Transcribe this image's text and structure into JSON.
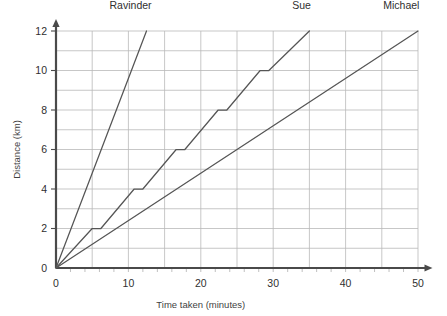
{
  "chart_data": {
    "type": "line",
    "title": "",
    "xlabel": "Time taken (minutes)",
    "ylabel": "Distance (km)",
    "xlim": [
      0,
      52
    ],
    "ylim": [
      0,
      12
    ],
    "xticks": [
      0,
      10,
      20,
      30,
      40,
      50
    ],
    "xtick_labels": [
      "0",
      "10",
      "20",
      "30",
      "40",
      "50"
    ],
    "yticks": [
      0,
      2,
      4,
      6,
      8,
      10,
      12
    ],
    "ytick_labels": [
      "0",
      "2",
      "4",
      "6",
      "8",
      "10",
      "12"
    ],
    "x_minor_tick_step": 2,
    "grid": true,
    "grid_x_step": 5,
    "grid_y_step": 1,
    "grid_color": "#b9b9b9",
    "axis_color": "#4a4a4a",
    "line_color": "#555555",
    "legend": "inline-end-labels",
    "legend_position": "above-line-ends",
    "series": [
      {
        "name": "Ravinder",
        "label": "Ravinder",
        "label_x": 13.2,
        "label_y": 13.1,
        "style": "straight",
        "points": [
          [
            0,
            0
          ],
          [
            12.5,
            12
          ]
        ]
      },
      {
        "name": "Sue",
        "label": "Sue",
        "label_x": 35.2,
        "label_y": 13.1,
        "style": "stepped-with-rests",
        "points": [
          [
            0,
            0
          ],
          [
            5.0,
            2
          ],
          [
            6.2,
            2
          ],
          [
            10.8,
            4
          ],
          [
            12.0,
            4
          ],
          [
            16.6,
            6
          ],
          [
            17.8,
            6
          ],
          [
            22.4,
            8
          ],
          [
            23.6,
            8
          ],
          [
            28.2,
            10
          ],
          [
            29.4,
            10
          ],
          [
            35.0,
            12
          ]
        ]
      },
      {
        "name": "Michael",
        "label": "Michael",
        "label_x": 50.2,
        "label_y": 13.1,
        "style": "straight",
        "points": [
          [
            0,
            0
          ],
          [
            50,
            12
          ]
        ]
      }
    ]
  }
}
